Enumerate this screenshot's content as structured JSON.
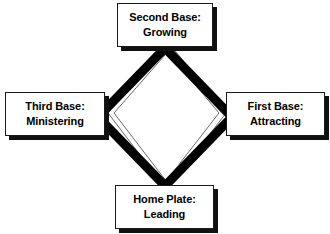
{
  "diagram": {
    "shape": "diamond",
    "colors": {
      "background": "#ffffff",
      "box_fill": "#ffffff",
      "box_border": "#1a1a1a",
      "box_shadow": "#111111",
      "thick_path": "#000000",
      "thin_path": "#555555",
      "text": "#000000"
    },
    "nodes": [
      {
        "id": "second-base",
        "position": "top",
        "line1": "Second Base:",
        "line2": "Growing"
      },
      {
        "id": "third-base",
        "position": "left",
        "line1": "Third Base:",
        "line2": "Ministering"
      },
      {
        "id": "first-base",
        "position": "right",
        "line1": "First Base:",
        "line2": "Attracting"
      },
      {
        "id": "home-plate",
        "position": "bottom",
        "line1": "Home Plate:",
        "line2": "Leading"
      }
    ],
    "paths": {
      "thick_diamond_label": "base-path",
      "thin_diamond_label": "outer-connector-path"
    }
  }
}
